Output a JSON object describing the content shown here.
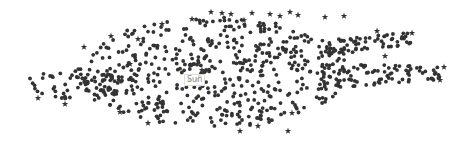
{
  "chart_data": {
    "type": "scatter",
    "title": "",
    "xlabel": "",
    "ylabel": "",
    "grid": false,
    "legend": "none",
    "marker_color": "#333333",
    "label_color": "#888888",
    "annotations": [
      {
        "text": "Sun",
        "x": 184,
        "y": 74
      }
    ],
    "regions": [
      {
        "name": "core",
        "cx": 215,
        "cy": 72,
        "rx": 135,
        "ry": 55,
        "count": 520
      },
      {
        "name": "left-tail",
        "cx": 80,
        "cy": 85,
        "rx": 58,
        "ry": 16,
        "count": 70
      },
      {
        "name": "upper-right-arm",
        "x0": 330,
        "x1": 412,
        "yTop0": 40,
        "yTop1": 32,
        "yBot0": 56,
        "yBot1": 44,
        "count": 60
      },
      {
        "name": "lower-right-arm",
        "x0": 320,
        "x1": 442,
        "yTop0": 64,
        "yTop1": 66,
        "yBot0": 90,
        "yBot1": 80,
        "count": 90
      }
    ],
    "star_markers": [
      [
        130,
        64
      ],
      [
        38,
        98
      ],
      [
        65,
        104
      ],
      [
        84,
        47
      ],
      [
        111,
        36
      ],
      [
        138,
        39
      ],
      [
        162,
        24
      ],
      [
        192,
        19
      ],
      [
        211,
        12
      ],
      [
        222,
        13
      ],
      [
        231,
        14
      ],
      [
        244,
        20
      ],
      [
        252,
        13
      ],
      [
        270,
        14
      ],
      [
        280,
        16
      ],
      [
        290,
        12
      ],
      [
        298,
        15
      ],
      [
        325,
        17
      ],
      [
        344,
        16
      ],
      [
        377,
        31
      ],
      [
        412,
        33
      ],
      [
        385,
        56
      ],
      [
        444,
        67
      ],
      [
        440,
        80
      ],
      [
        120,
        112
      ],
      [
        148,
        123
      ],
      [
        240,
        131
      ],
      [
        258,
        126
      ],
      [
        288,
        131
      ],
      [
        292,
        113
      ],
      [
        202,
        70
      ]
    ]
  }
}
